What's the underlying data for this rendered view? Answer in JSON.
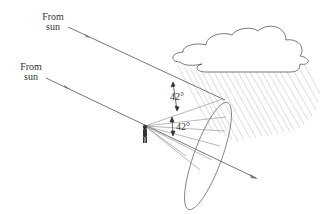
{
  "diagram": {
    "labels": {
      "sun_upper_line1": "From",
      "sun_upper_line2": "sun",
      "sun_lower_line1": "From",
      "sun_lower_line2": "sun",
      "angle_upper": "42°",
      "angle_lower": "42°"
    },
    "elements": [
      "sun ray (upper)",
      "sun ray (lower, through observer)",
      "rain cloud",
      "rain streaks",
      "observer",
      "rainbow cone ellipse",
      "cone lines"
    ],
    "colors": {
      "ray": "#777777",
      "outline": "#555555",
      "rain": "#bbbbbb",
      "text": "#333333"
    }
  }
}
